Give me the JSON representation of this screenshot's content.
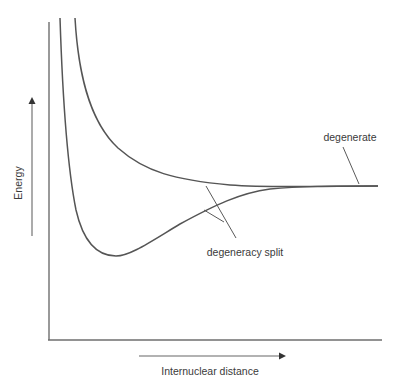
{
  "diagram": {
    "y_axis_label": "Energy",
    "x_axis_label": "Internuclear distance",
    "annotations": {
      "degenerate": "degenerate",
      "degeneracy_split": "degeneracy split"
    },
    "curves": [
      {
        "name": "bonding",
        "shape": "well with minimum, rising steeply at short distance, converging to asymptote"
      },
      {
        "name": "antibonding",
        "shape": "repulsive, decreasing monotonically to asymptote"
      }
    ],
    "colors": {
      "curve": "#555555",
      "axis": "#6e6e6e",
      "text": "#3a3a3a"
    }
  }
}
